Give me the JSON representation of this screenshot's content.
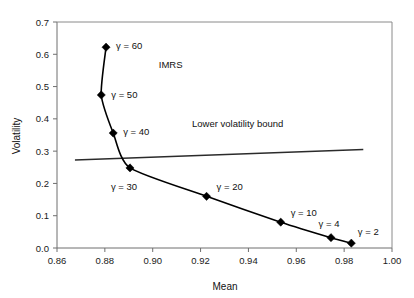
{
  "chart_data": {
    "type": "line",
    "title": "",
    "xlabel": "Mean",
    "ylabel": "Volatility",
    "xlim": [
      0.86,
      1.0
    ],
    "ylim": [
      0.0,
      0.7
    ],
    "xticks": [
      "0.86",
      "0.88",
      "0.90",
      "0.92",
      "0.94",
      "0.96",
      "0.98",
      "1.00"
    ],
    "xtick_values": [
      0.86,
      0.88,
      0.9,
      0.92,
      0.94,
      0.96,
      0.98,
      1.0
    ],
    "yticks": [
      "0.0",
      "0.1",
      "0.2",
      "0.3",
      "0.4",
      "0.5",
      "0.6",
      "0.7"
    ],
    "ytick_values": [
      0.0,
      0.1,
      0.2,
      0.3,
      0.4,
      0.5,
      0.6,
      0.7
    ],
    "grid": false,
    "legend_position": "none",
    "series": [
      {
        "name": "IMRS frontier",
        "marker": "diamond",
        "x": [
          0.8805,
          0.8785,
          0.8835,
          0.8905,
          0.9225,
          0.9535,
          0.9745,
          0.983
        ],
        "y": [
          0.622,
          0.474,
          0.356,
          0.248,
          0.16,
          0.08,
          0.032,
          0.015
        ],
        "point_labels": [
          "γ = 60",
          "γ = 50",
          "γ = 40",
          "γ = 30",
          "γ = 20",
          "γ = 10",
          "γ = 4",
          "γ = 2"
        ],
        "gamma_values": [
          60,
          50,
          40,
          30,
          20,
          10,
          4,
          2
        ]
      },
      {
        "name": "Lower volatility bound",
        "marker": "none",
        "x": [
          0.8675,
          0.988
        ],
        "y": [
          0.2725,
          0.305
        ]
      }
    ],
    "annotations": [
      {
        "text": "IMRS",
        "x": 0.9075,
        "y": 0.5565
      },
      {
        "text": "Lower volatility bound",
        "x": 0.9355,
        "y": 0.3755
      }
    ]
  },
  "axes": {
    "x_title": "Mean",
    "y_title": "Volatility"
  },
  "colors": {
    "curve": "#000000",
    "bound": "#2b2b2b",
    "axis": "#6f6f6f",
    "text": "#111111",
    "background": "#ffffff"
  }
}
